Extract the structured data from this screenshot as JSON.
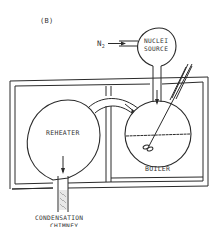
{
  "figure": {
    "panel_label": "(B)",
    "colors": {
      "line": "#2a2a2a",
      "text": "#333333",
      "background": "#ffffff"
    }
  },
  "labels": {
    "gas_inlet": "N",
    "gas_inlet_subscript": "2",
    "nuclei_source_line1": "NUCLEI",
    "nuclei_source_line2": "SOURCE",
    "reheater": "REHEATER",
    "boiler": "BOILER",
    "chimney_line1": "CONDENSATION",
    "chimney_line2": "CHIMNEY"
  }
}
